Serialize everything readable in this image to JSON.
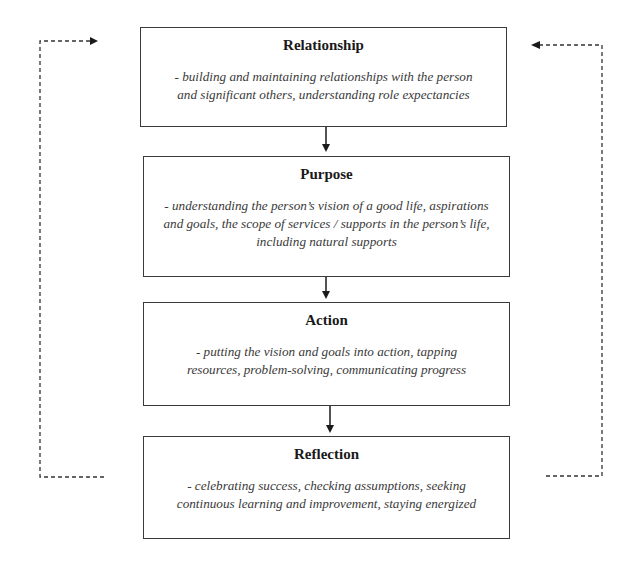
{
  "diagram": {
    "type": "cyclical-flow",
    "stages": [
      {
        "title": "Relationship",
        "description": "- building and maintaining relationships with the person and significant others, understanding role expectancies"
      },
      {
        "title": "Purpose",
        "description": "- understanding the person’s vision of a good life, aspirations and goals, the scope  of services / supports in the person’s life, including natural supports"
      },
      {
        "title": "Action",
        "description": "- putting the vision and goals into action, tapping resources, problem-solving, communicating progress"
      },
      {
        "title": "Reflection",
        "description": "- celebrating success, checking assumptions, seeking continuous learning and improvement, staying energized"
      }
    ],
    "connectors": {
      "solid": [
        "Relationship → Purpose",
        "Purpose → Action",
        "Action → Reflection"
      ],
      "dashed_feedback": [
        "Reflection → Relationship (left loop)",
        "Reflection → Relationship (right loop)"
      ]
    },
    "colors": {
      "border": "#3a3a3a",
      "title": "#1a1a1a",
      "description": "#3a3a3a",
      "background": "#ffffff"
    }
  }
}
